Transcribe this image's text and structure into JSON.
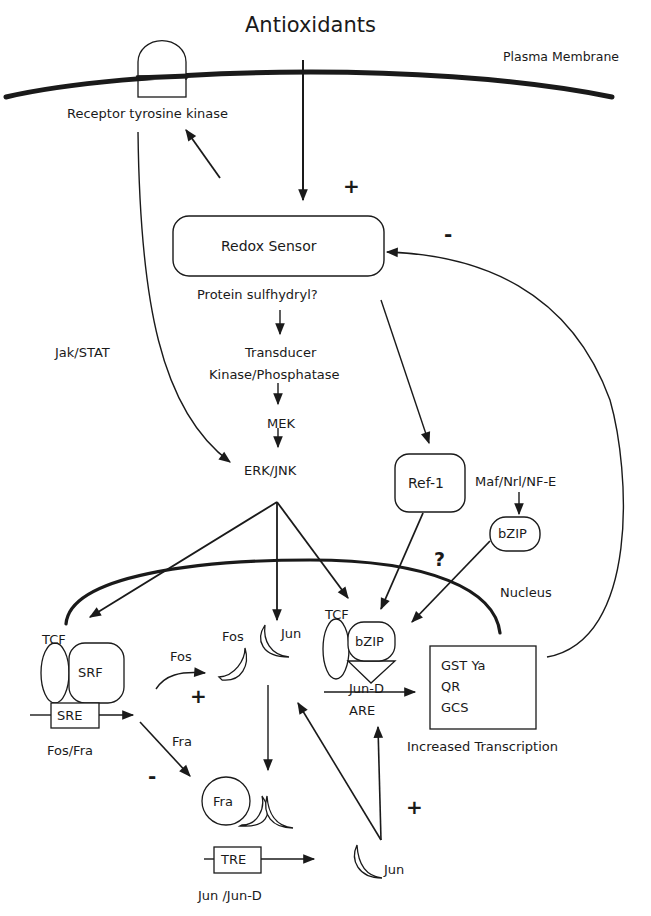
{
  "figure": {
    "title": "Antioxidants",
    "membrane_label": "Plasma Membrane",
    "nucleus_label": "Nucleus",
    "colors": {
      "ink": "#1a1a1a",
      "background": "#ffffff"
    }
  },
  "nodes": {
    "receptor": "Receptor tyrosine kinase",
    "redox_sensor": "Redox Sensor",
    "protein_sulfhydryl": "Protein sulfhydryl?",
    "transducer": "Transducer",
    "kinase_phosphatase": "Kinase/Phosphatase",
    "mek": "MEK",
    "erk_jnk": "ERK/JNK",
    "jak_stat": "Jak/STAT",
    "ref1": "Ref-1",
    "maf": "Maf/Nrl/NF-E",
    "bzip_cyto": "bZIP",
    "question": "?",
    "tcf_left": "TCF",
    "srf": "SRF",
    "sre": "SRE",
    "fos_fra_label": "Fos/Fra",
    "fos_arrow_label": "Fos",
    "fos_protein": "Fos",
    "jun_protein": "Jun",
    "tcf_right": "TCF",
    "bzip_nuclear": "bZIP",
    "jun_d": "Jun-D",
    "are": "ARE",
    "fra_arrow_label": "Fra",
    "fra_protein": "Fra",
    "tre": "TRE",
    "jun_jund_label": "Jun  /Jun-D",
    "jun_bottom": "Jun",
    "increased_transcription": "Increased Transcription"
  },
  "target_genes": [
    "GST Ya",
    "QR",
    "GCS"
  ],
  "signs": {
    "antioxidant_plus": "+",
    "feedback_minus": "-",
    "fos_plus": "+",
    "fra_minus": "-",
    "jun_plus": "+"
  }
}
